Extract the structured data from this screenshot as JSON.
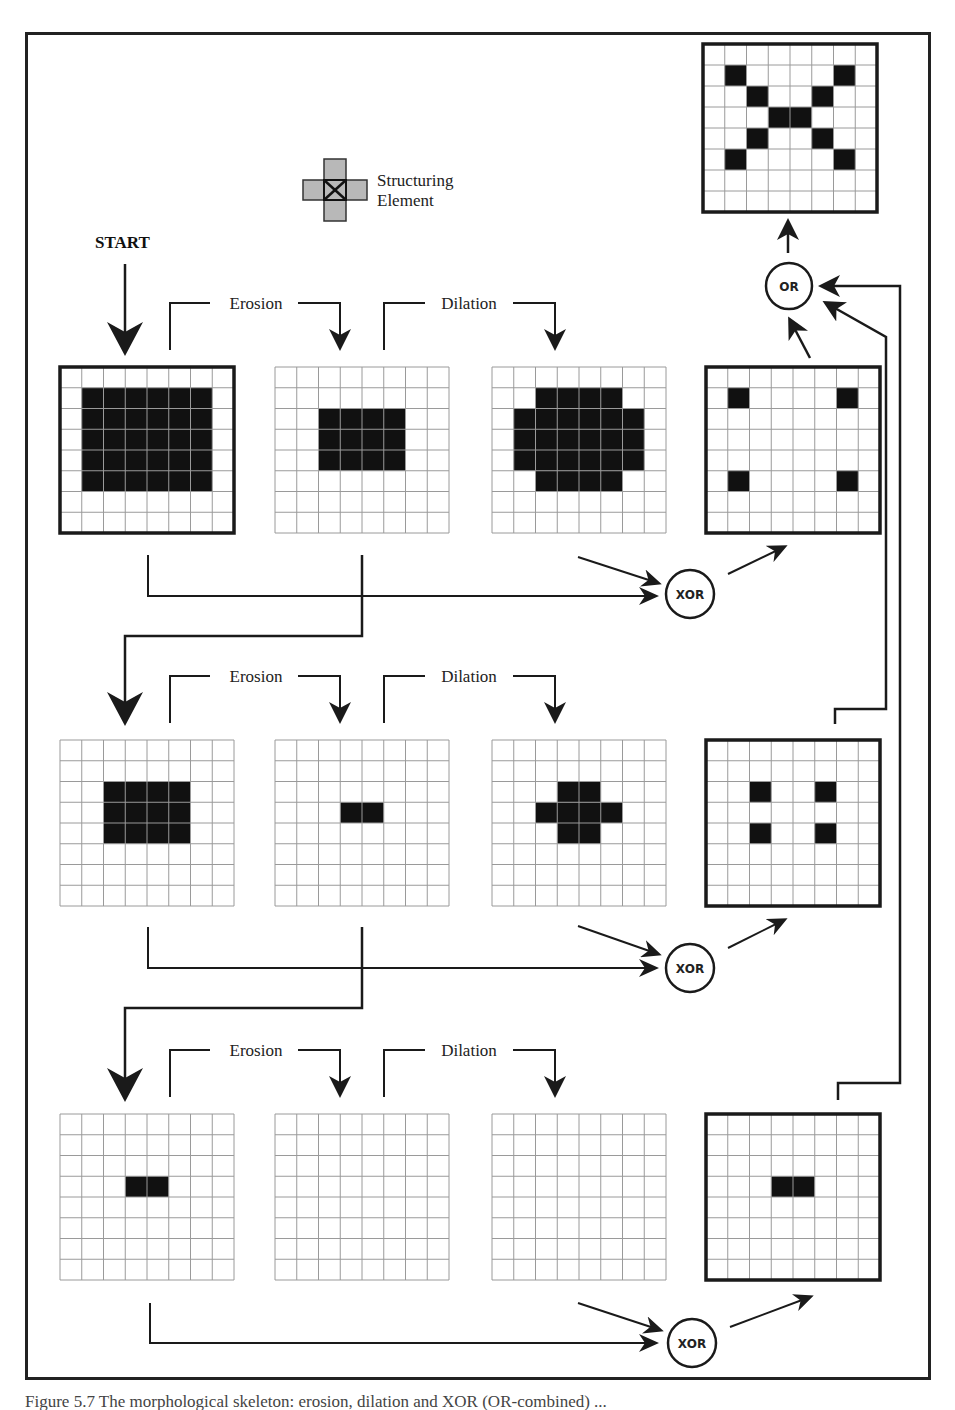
{
  "figure": {
    "start_label": "START",
    "structuring_element": {
      "label_line1": "Structuring",
      "label_line2": "Element",
      "shape": "cross-3x3",
      "origin_marker": "x"
    },
    "step_labels": {
      "erosion": "Erosion",
      "dilation": "Dilation"
    },
    "operators": {
      "xor": "XOR",
      "or": "OR"
    },
    "grid_size": 8,
    "rows": [
      {
        "name": "level-1",
        "input": {
          "filled": [
            [
              1,
              1,
              6,
              5
            ]
          ]
        },
        "eroded": {
          "filled": [
            [
              2,
              2,
              4,
              3
            ]
          ]
        },
        "dilated": {
          "filled": [
            [
              2,
              1,
              4,
              1
            ],
            [
              1,
              2,
              6,
              3
            ],
            [
              2,
              5,
              4,
              1
            ]
          ]
        },
        "xor": {
          "filled": [
            [
              1,
              1,
              1,
              1
            ],
            [
              6,
              1,
              1,
              1
            ],
            [
              1,
              5,
              1,
              1
            ],
            [
              6,
              5,
              1,
              1
            ]
          ]
        }
      },
      {
        "name": "level-2",
        "input": {
          "filled": [
            [
              2,
              2,
              4,
              3
            ]
          ]
        },
        "eroded": {
          "filled": [
            [
              3,
              3,
              2,
              1
            ]
          ]
        },
        "dilated": {
          "filled": [
            [
              3,
              2,
              2,
              1
            ],
            [
              2,
              3,
              4,
              1
            ],
            [
              3,
              4,
              2,
              1
            ]
          ]
        },
        "xor": {
          "filled": [
            [
              2,
              2,
              1,
              1
            ],
            [
              5,
              2,
              1,
              1
            ],
            [
              2,
              4,
              1,
              1
            ],
            [
              5,
              4,
              1,
              1
            ]
          ]
        }
      },
      {
        "name": "level-3",
        "input": {
          "filled": [
            [
              3,
              3,
              2,
              1
            ]
          ]
        },
        "eroded": {
          "filled": []
        },
        "dilated": {
          "filled": []
        },
        "xor": {
          "filled": [
            [
              3,
              3,
              2,
              1
            ]
          ]
        }
      }
    ],
    "final_result": {
      "filled": [
        [
          1,
          1,
          1,
          1
        ],
        [
          6,
          1,
          1,
          1
        ],
        [
          2,
          2,
          1,
          1
        ],
        [
          5,
          2,
          1,
          1
        ],
        [
          3,
          3,
          2,
          1
        ],
        [
          2,
          4,
          1,
          1
        ],
        [
          5,
          4,
          1,
          1
        ],
        [
          1,
          5,
          1,
          1
        ],
        [
          6,
          5,
          1,
          1
        ]
      ]
    },
    "colors": {
      "ink": "#1a1a1a",
      "grid_line": "#9a9a9a",
      "fill": "#111111",
      "se_fill": "#b8b8b8"
    }
  },
  "caption": "Figure 5.7  The morphological skeleton: erosion, dilation and XOR (OR-combined) ..."
}
